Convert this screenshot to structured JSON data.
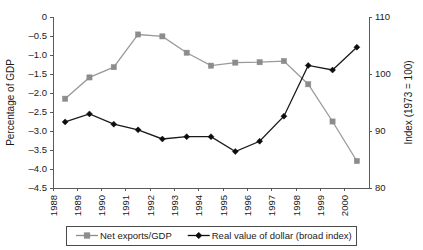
{
  "chart_data": {
    "type": "line",
    "title": "",
    "xlabel": "",
    "ylabel": "Percentage of GDP",
    "y2label": "Index (1973 = 100)",
    "grid": false,
    "legend_position": "bottom",
    "x": [
      1988.5,
      1989.5,
      1990.5,
      1991.5,
      1992.5,
      1993.5,
      1994.5,
      1995.5,
      1996.5,
      1997.5,
      1998.5,
      1999.5,
      2000.5
    ],
    "categories": [
      "1988",
      "1989",
      "1990",
      "1991",
      "1992",
      "1993",
      "1994",
      "1995",
      "1996",
      "1997",
      "1998",
      "1999",
      "2000"
    ],
    "xtick_labels": [
      "1988",
      "1989",
      "1990",
      "1991",
      "1992",
      "1993",
      "1994",
      "1995",
      "1996",
      "1997",
      "1998",
      "1999",
      "2000"
    ],
    "xlim": [
      1988,
      2001
    ],
    "ylim": [
      -4.5,
      0
    ],
    "ytick_labels": [
      "0",
      "–0.5",
      "–1.0",
      "–1.5",
      "–2.0",
      "–2.5",
      "–3.0",
      "–3.5",
      "–4.0",
      "–4.5"
    ],
    "ytick_values": [
      0,
      -0.5,
      -1.0,
      -1.5,
      -2.0,
      -2.5,
      -3.0,
      -3.5,
      -4.0,
      -4.5
    ],
    "y2lim": [
      80,
      110
    ],
    "y2tick_labels": [
      "80",
      "90",
      "100",
      "110"
    ],
    "y2tick_values": [
      80,
      90,
      100,
      110
    ],
    "series": [
      {
        "name": "Net exports/GDP",
        "axis": "left",
        "color": "#8c8c8c",
        "marker": "square",
        "values": [
          -2.15,
          -1.59,
          -1.32,
          -0.46,
          -0.51,
          -0.94,
          -1.28,
          -1.2,
          -1.19,
          -1.16,
          -1.77,
          -2.75,
          -3.79
        ]
      },
      {
        "name": "Real value of dollar (broad index)",
        "axis": "right",
        "color": "#0d0d0d",
        "marker": "diamond",
        "values": [
          91.6,
          93.0,
          91.2,
          90.2,
          88.6,
          89.0,
          89.0,
          86.4,
          88.2,
          92.6,
          101.5,
          100.7,
          104.7
        ]
      }
    ]
  },
  "legend": {
    "items": [
      {
        "label": "Net exports/GDP",
        "color": "#8c8c8c",
        "marker": "square"
      },
      {
        "label": "Real value of dollar (broad index)",
        "color": "#0d0d0d",
        "marker": "diamond"
      }
    ]
  }
}
